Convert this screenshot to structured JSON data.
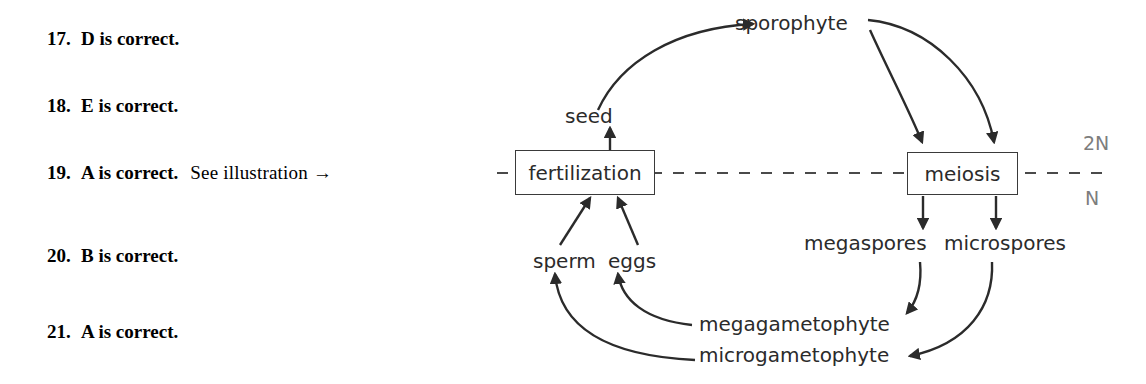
{
  "answers": {
    "items": [
      {
        "number": "17.",
        "text": "D is correct.",
        "note": ""
      },
      {
        "number": "18.",
        "text": "E is correct.",
        "note": ""
      },
      {
        "number": "19.",
        "text": "A is correct.",
        "note": "See illustration →"
      },
      {
        "number": "20.",
        "text": "B is correct.",
        "note": ""
      },
      {
        "number": "21.",
        "text": "A is correct.",
        "note": ""
      }
    ]
  },
  "diagram": {
    "boxes": [
      {
        "id": "fertilization",
        "label": "fertilization"
      },
      {
        "id": "meiosis",
        "label": "meiosis"
      }
    ],
    "labels": [
      {
        "id": "sporophyte",
        "label": "sporophyte"
      },
      {
        "id": "seed",
        "label": "seed"
      },
      {
        "id": "sperm",
        "label": "sperm"
      },
      {
        "id": "eggs",
        "label": "eggs"
      },
      {
        "id": "megaspores",
        "label": "megaspores"
      },
      {
        "id": "microspores",
        "label": "microspores"
      },
      {
        "id": "megagametophyte",
        "label": "megagametophyte"
      },
      {
        "id": "microgametophyte",
        "label": "microgametophyte"
      }
    ],
    "ploidy": {
      "diploid": "2N",
      "haploid": "N"
    },
    "colors": {
      "ink": "#2b2b2b",
      "stroke": "#3a3a3a",
      "ploidy_text": "#7d7d7d",
      "background": "#ffffff"
    }
  }
}
